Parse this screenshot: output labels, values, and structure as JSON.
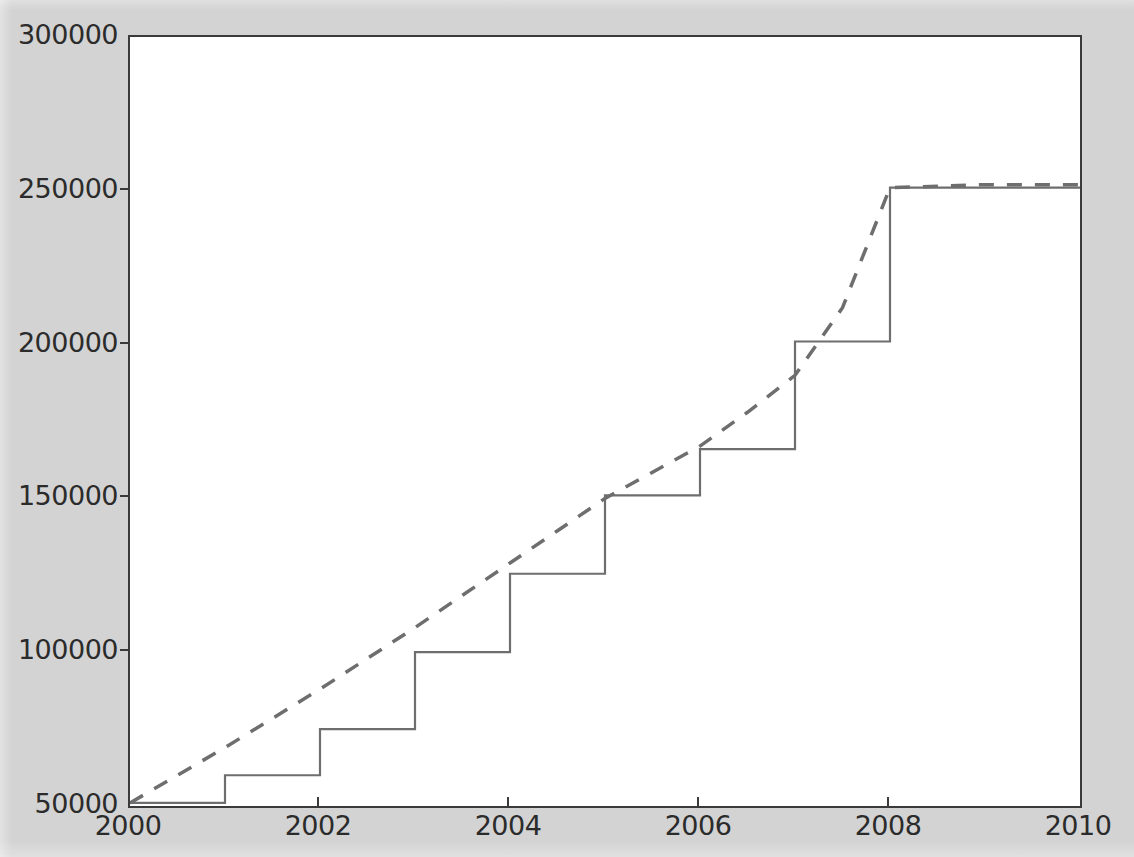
{
  "figure": {
    "background_color": "#d3d3d3",
    "axes_background_color": "#ffffff",
    "axes_edge_color": "#3a3a3a",
    "tick_label_color": "#2b2b2b"
  },
  "axis": {
    "y_ticks": [
      {
        "value": 300000,
        "label": "300000"
      },
      {
        "value": 250000,
        "label": "250000"
      },
      {
        "value": 200000,
        "label": "200000"
      },
      {
        "value": 150000,
        "label": "150000"
      },
      {
        "value": 100000,
        "label": "100000"
      },
      {
        "value": 50000,
        "label": "50000"
      }
    ],
    "x_ticks": [
      {
        "value": 2000,
        "label": "2000"
      },
      {
        "value": 2002,
        "label": "2002"
      },
      {
        "value": 2004,
        "label": "2004"
      },
      {
        "value": 2006,
        "label": "2006"
      },
      {
        "value": 2008,
        "label": "2008"
      },
      {
        "value": 2010,
        "label": "2010"
      }
    ]
  },
  "chart_data": {
    "type": "line",
    "title": "",
    "xlabel": "",
    "ylabel": "",
    "xlim": [
      2000,
      2010
    ],
    "ylim": [
      50000,
      300000
    ],
    "grid": false,
    "legend": null,
    "series": [
      {
        "name": "step-series",
        "style": "solid",
        "color": "#6e6e6e",
        "linewidth": 2,
        "drawstyle": "steps-post",
        "x": [
          2000,
          2001,
          2002,
          2003,
          2004,
          2005,
          2006,
          2007,
          2008,
          2009,
          2010
        ],
        "values": [
          51000,
          60000,
          75000,
          100000,
          125500,
          151000,
          166000,
          201000,
          251000,
          251000,
          251000
        ]
      },
      {
        "name": "smooth-series",
        "style": "dashed",
        "color": "#6e6e6e",
        "linewidth": 3,
        "dash_pattern": "14,12",
        "x": [
          2000,
          2000.5,
          2001,
          2001.5,
          2002,
          2002.5,
          2003,
          2003.5,
          2004,
          2004.5,
          2005,
          2005.5,
          2006,
          2006.5,
          2007,
          2007.5,
          2008,
          2008.5,
          2009,
          2009.5,
          2010
        ],
        "values": [
          51000,
          60000,
          69000,
          78500,
          88000,
          98000,
          108000,
          118500,
          129000,
          139500,
          150000,
          158500,
          167000,
          178000,
          190000,
          212000,
          251000,
          251500,
          252000,
          252000,
          252000
        ]
      }
    ]
  }
}
